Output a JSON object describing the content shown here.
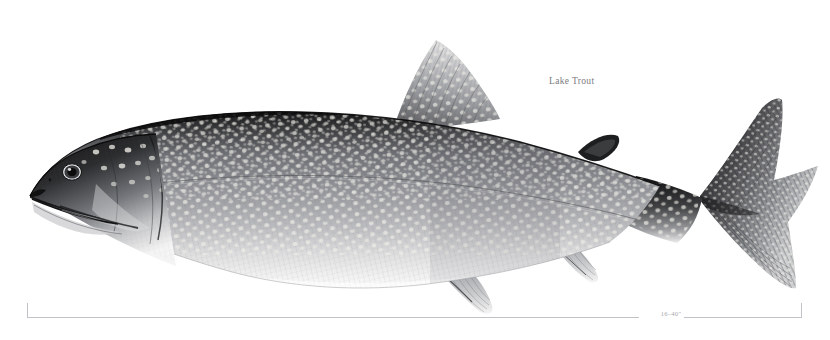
{
  "plate": {
    "background_color": "#ffffff",
    "subject": "lake-trout-side-view-illustration",
    "medium": "grayscale scientific illustration",
    "orientation": "left-facing lateral profile"
  },
  "caption": {
    "common_name": "Lake Trout",
    "text_color": "#7b7b7f"
  },
  "scale": {
    "range_label": "16–40\"",
    "line_color": "#c2c2c6",
    "label_color": "#a9a9ad"
  },
  "anatomy": {
    "parts": [
      {
        "name": "head",
        "note": "dark dorsally, pale light spots, large terminal mouth"
      },
      {
        "name": "eye",
        "note": "large round eye with dark pupil and pale iris ring"
      },
      {
        "name": "operculum",
        "note": "gill cover with light vermiculate spotting"
      },
      {
        "name": "pectoral-fin",
        "note": "low on body behind gill, finely rayed, pale"
      },
      {
        "name": "pelvic-fin",
        "note": "ventral mid-body, pale with dark rays"
      },
      {
        "name": "dorsal-fin",
        "note": "tall triangular, heavily spotted between rays"
      },
      {
        "name": "adipose-fin",
        "note": "small dark fleshy lobe before tail"
      },
      {
        "name": "anal-fin",
        "note": "ventral, posterior, pale rayed"
      },
      {
        "name": "caudal-fin",
        "note": "deeply forked, spotted, dark margins"
      },
      {
        "name": "lateral-line",
        "note": "faint line running head to tail"
      },
      {
        "name": "flank",
        "note": "mid gray with dense pale cream spots"
      },
      {
        "name": "belly",
        "note": "pale, fading to white ventrally"
      }
    ],
    "tones": {
      "dorsal_dark": "#1e1e1f",
      "flank_mid": "#8f9095",
      "belly_light": "#f2f2f2",
      "spot_light": "#e8e8e4"
    }
  }
}
